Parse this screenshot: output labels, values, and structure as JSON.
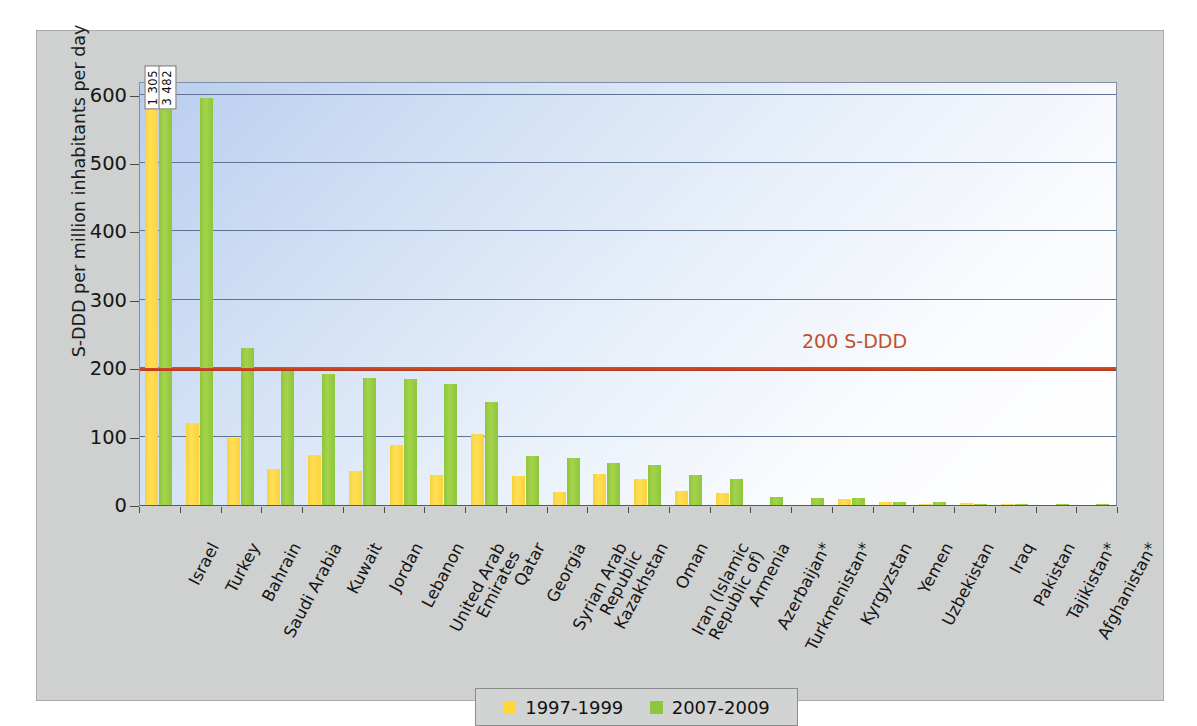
{
  "chart_data": {
    "type": "bar",
    "title": "",
    "xlabel": "",
    "ylabel": "S-DDD per million inhabitants per day",
    "ylim": [
      0,
      620
    ],
    "yticks": [
      0,
      100,
      200,
      300,
      400,
      500,
      600
    ],
    "ytick_labels": [
      "0",
      "100",
      "200",
      "300",
      "400",
      "500",
      "600"
    ],
    "grid": true,
    "legend_position": "bottom-center",
    "categories": [
      "Israel",
      "Turkey",
      "Bahrain",
      "Saudi Arabia",
      "Kuwait",
      "Jordan",
      "Lebanon",
      "United Arab Emirates",
      "Qatar",
      "Georgia",
      "Syrian Arab Republic",
      "Kazakhstan",
      "Oman",
      "Iran (Islamic Republic of)",
      "Armenia",
      "Azerbaijan*",
      "Turkmenistan*",
      "Kyrgyzstan",
      "Yemen",
      "Uzbekistan",
      "Iraq",
      "Pakistan",
      "Tajikistan*",
      "Afghanistan*"
    ],
    "category_lines": [
      [
        "Israel"
      ],
      [
        "Turkey"
      ],
      [
        "Bahrain"
      ],
      [
        "Saudi Arabia"
      ],
      [
        "Kuwait"
      ],
      [
        "Jordan"
      ],
      [
        "Lebanon"
      ],
      [
        "United Arab",
        "Emirates"
      ],
      [
        "Qatar"
      ],
      [
        "Georgia"
      ],
      [
        "Syrian Arab",
        "Republic"
      ],
      [
        "Kazakhstan"
      ],
      [
        "Oman"
      ],
      [
        "Iran (Islamic",
        "Republic of)"
      ],
      [
        "Armenia"
      ],
      [
        "Azerbaijan*"
      ],
      [
        "Turkmenistan*"
      ],
      [
        "Kyrgyzstan"
      ],
      [
        "Yemen"
      ],
      [
        "Uzbekistan"
      ],
      [
        "Iraq"
      ],
      [
        "Pakistan"
      ],
      [
        "Tajikistan*"
      ],
      [
        "Afghanistan*"
      ]
    ],
    "series": [
      {
        "name": "1997-1999",
        "color": "#ffd633",
        "values": [
          1305,
          120,
          98,
          52,
          73,
          50,
          88,
          44,
          104,
          42,
          19,
          45,
          38,
          20,
          17,
          0,
          0,
          9,
          4,
          2,
          3,
          1,
          0,
          0
        ]
      },
      {
        "name": "2007-2009",
        "color": "#8dc63f",
        "values": [
          3482,
          595,
          230,
          200,
          191,
          186,
          184,
          177,
          150,
          72,
          69,
          62,
          59,
          44,
          38,
          11,
          10,
          10,
          5,
          5,
          2,
          1,
          1,
          1
        ]
      }
    ],
    "annotations": [
      {
        "name": "threshold-line",
        "label": "200 S-DDD",
        "value": 197,
        "color": "#c0522f"
      }
    ],
    "value_callouts": [
      {
        "category": "Israel",
        "series": "1997-1999",
        "label": "1 305"
      },
      {
        "category": "Israel",
        "series": "2007-2009",
        "label": "3 482"
      }
    ]
  },
  "legend": {
    "items": [
      {
        "label": "1997-1999",
        "swatch": "old"
      },
      {
        "label": "2007-2009",
        "swatch": "new"
      }
    ]
  }
}
